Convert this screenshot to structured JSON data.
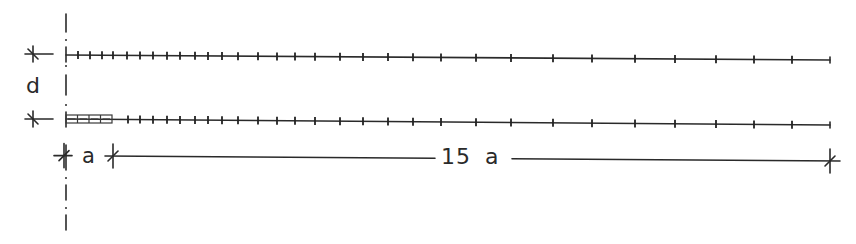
{
  "diagram": {
    "type": "structural-beam-spacing-schematic",
    "stroke_color": "#2a2a2a",
    "background": "#ffffff",
    "labels": {
      "depth": "d",
      "first_spacing": "a",
      "remaining_span": "15 a"
    },
    "centerline": {
      "x": 66,
      "style": "dash-dot",
      "dashes": [
        [
          14,
          32
        ],
        [
          75,
          95
        ],
        [
          145,
          170
        ],
        [
          185,
          200
        ],
        [
          215,
          230
        ]
      ],
      "dots": [
        40,
        66,
        105,
        178,
        208
      ]
    },
    "top_member": {
      "x_start": 66,
      "x_end": 830,
      "y_start": 55,
      "y_end": 60,
      "tick_x": [
        78,
        90,
        102,
        113,
        127,
        140,
        153,
        167,
        180,
        195,
        208,
        222,
        238,
        258,
        277,
        295,
        315,
        340,
        363,
        388,
        413,
        441,
        476,
        511,
        553,
        592,
        635,
        675,
        716,
        754,
        792
      ]
    },
    "bottom_member": {
      "x_start": 66,
      "x_end": 830,
      "y_start": 119,
      "y_end": 125,
      "hatched_block": {
        "x": 66,
        "y": 115,
        "width": 46,
        "height": 8,
        "cells": 4
      },
      "tick_x": [
        128,
        140,
        153,
        167,
        180,
        195,
        208,
        222,
        238,
        258,
        277,
        295,
        315,
        340,
        363,
        388,
        413,
        441,
        476,
        511,
        553,
        592,
        635,
        675,
        716,
        754,
        792
      ]
    },
    "depth_dimension": {
      "x_start": 25,
      "x_end": 53,
      "mark_x": 33,
      "y_top": 54,
      "y_bottom": 119
    },
    "span_dimension": {
      "y_left": 156,
      "y_right": 161,
      "ticks_x": [
        64,
        113,
        830
      ],
      "text_gap": [
        435,
        512
      ]
    }
  }
}
